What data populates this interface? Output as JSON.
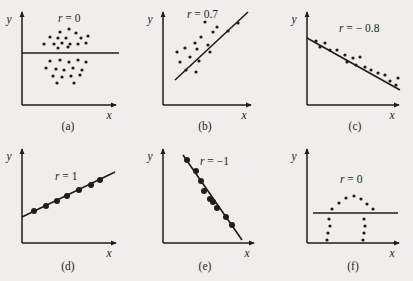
{
  "figure": {
    "width": 413,
    "height": 281,
    "background_color": "#f0eeea",
    "ink_color": "#1d1d1d",
    "axis_label_x": "x",
    "axis_label_y": "y"
  },
  "chart_data": {
    "type": "scatter",
    "title": "",
    "xlabel": "x",
    "ylabel": "y",
    "grid": false,
    "legend": "none",
    "layout": {
      "rows": 2,
      "cols": 3
    },
    "panels": [
      {
        "id": "a",
        "caption": "(a)",
        "r_label": "r = 0",
        "r_value": 0,
        "origin": [
          22,
          105
        ],
        "x_axis_end": [
          120,
          105
        ],
        "y_axis_top": [
          22,
          8
        ],
        "label_pos": [
          58,
          22
        ],
        "caption_pos": [
          68,
          130
        ],
        "dot_radius": 1.6,
        "fit_line": {
          "x1": 22,
          "y1": 53,
          "x2": 119,
          "y2": 53
        },
        "points": [
          [
            60,
            32
          ],
          [
            69,
            29
          ],
          [
            76,
            33
          ],
          [
            50,
            37
          ],
          [
            58,
            38
          ],
          [
            66,
            38
          ],
          [
            81,
            38
          ],
          [
            88,
            36
          ],
          [
            44,
            44
          ],
          [
            54,
            44
          ],
          [
            62,
            43
          ],
          [
            70,
            44
          ],
          [
            78,
            44
          ],
          [
            86,
            43
          ],
          [
            58,
            48
          ],
          [
            68,
            47
          ],
          [
            50,
            61
          ],
          [
            60,
            60
          ],
          [
            69,
            62
          ],
          [
            78,
            60
          ],
          [
            86,
            62
          ],
          [
            46,
            68
          ],
          [
            56,
            69
          ],
          [
            64,
            70
          ],
          [
            73,
            68
          ],
          [
            82,
            70
          ],
          [
            53,
            76
          ],
          [
            62,
            77
          ],
          [
            71,
            76
          ],
          [
            80,
            75
          ],
          [
            57,
            83
          ],
          [
            74,
            83
          ]
        ]
      },
      {
        "id": "b",
        "caption": "(b)",
        "r_label": "r = 0.7",
        "r_value": 0.7,
        "origin": [
          163,
          105
        ],
        "x_axis_end": [
          255,
          105
        ],
        "y_axis_top": [
          163,
          8
        ],
        "label_pos": [
          187,
          18
        ],
        "caption_pos": [
          205,
          130
        ],
        "dot_radius": 1.6,
        "fit_line": {
          "x1": 175,
          "y1": 80,
          "x2": 248,
          "y2": 12
        },
        "points": [
          [
            205,
            22
          ],
          [
            217,
            27
          ],
          [
            213,
            32
          ],
          [
            201,
            37
          ],
          [
            195,
            43
          ],
          [
            208,
            45
          ],
          [
            185,
            48
          ],
          [
            197,
            49
          ],
          [
            210,
            52
          ],
          [
            177,
            52
          ],
          [
            190,
            57
          ],
          [
            199,
            61
          ],
          [
            180,
            62
          ],
          [
            186,
            70
          ],
          [
            196,
            72
          ],
          [
            238,
            23
          ],
          [
            228,
            31
          ]
        ]
      },
      {
        "id": "c",
        "caption": "(c)",
        "r_label": "r = − 0.8",
        "r_value": -0.8,
        "origin": [
          307,
          105
        ],
        "x_axis_end": [
          403,
          105
        ],
        "y_axis_top": [
          307,
          8
        ],
        "label_pos": [
          339,
          32
        ],
        "caption_pos": [
          355,
          130
        ],
        "dot_radius": 1.6,
        "fit_line": {
          "x1": 307,
          "y1": 38,
          "x2": 400,
          "y2": 90
        },
        "points": [
          [
            316,
            41
          ],
          [
            325,
            43
          ],
          [
            320,
            47
          ],
          [
            330,
            50
          ],
          [
            337,
            50
          ],
          [
            345,
            55
          ],
          [
            353,
            58
          ],
          [
            360,
            57
          ],
          [
            347,
            62
          ],
          [
            356,
            65
          ],
          [
            365,
            67
          ],
          [
            371,
            70
          ],
          [
            378,
            73
          ],
          [
            385,
            75
          ],
          [
            390,
            81
          ],
          [
            396,
            85
          ],
          [
            398,
            78
          ]
        ]
      },
      {
        "id": "d",
        "caption": "(d)",
        "r_label": "r = 1",
        "r_value": 1,
        "origin": [
          22,
          243
        ],
        "x_axis_end": [
          120,
          243
        ],
        "y_axis_top": [
          22,
          145
        ],
        "label_pos": [
          55,
          180
        ],
        "caption_pos": [
          68,
          270
        ],
        "dot_radius": 3.0,
        "fit_line": {
          "x1": 22,
          "y1": 217,
          "x2": 115,
          "y2": 172
        },
        "points": [
          [
            34,
            211
          ],
          [
            46,
            206
          ],
          [
            57,
            201
          ],
          [
            67,
            196
          ],
          [
            79,
            190
          ],
          [
            91,
            185
          ],
          [
            100,
            180
          ]
        ]
      },
      {
        "id": "e",
        "caption": "(e)",
        "r_label": "r = −1",
        "r_value": -1,
        "origin": [
          163,
          243
        ],
        "x_axis_end": [
          258,
          243
        ],
        "y_axis_top": [
          163,
          145
        ],
        "label_pos": [
          200,
          165
        ],
        "caption_pos": [
          205,
          270
        ],
        "dot_radius": 3.0,
        "fit_line": {
          "x1": 183,
          "y1": 155,
          "x2": 242,
          "y2": 240
        },
        "points": [
          [
            187,
            160
          ],
          [
            196,
            171
          ],
          [
            201,
            181
          ],
          [
            204,
            191
          ],
          [
            210,
            199
          ],
          [
            213,
            202
          ],
          [
            217,
            208
          ],
          [
            226,
            217
          ],
          [
            232,
            225
          ]
        ]
      },
      {
        "id": "f",
        "caption": "(f)",
        "r_label": "r = 0",
        "r_value": 0,
        "origin": [
          307,
          243
        ],
        "x_axis_end": [
          403,
          243
        ],
        "y_axis_top": [
          307,
          145
        ],
        "label_pos": [
          340,
          183
        ],
        "caption_pos": [
          353,
          270
        ],
        "dot_radius": 1.6,
        "fit_line": {
          "x1": 313,
          "y1": 213,
          "x2": 398,
          "y2": 213
        },
        "points": [
          [
            339,
            203
          ],
          [
            346,
            198
          ],
          [
            354,
            196
          ],
          [
            361,
            199
          ],
          [
            367,
            204
          ],
          [
            332,
            209
          ],
          [
            373,
            209
          ],
          [
            329,
            219
          ],
          [
            330,
            226
          ],
          [
            328,
            233
          ],
          [
            327,
            240
          ],
          [
            364,
            219
          ],
          [
            365,
            226
          ],
          [
            364,
            233
          ],
          [
            363,
            240
          ]
        ]
      }
    ]
  }
}
